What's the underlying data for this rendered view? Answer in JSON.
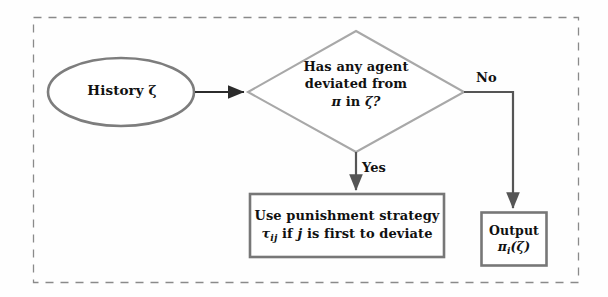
{
  "figure": {
    "type": "flowchart",
    "title": "",
    "background_color": "#fefefe",
    "border": {
      "style": "dashed",
      "color": "#8a8a8a"
    }
  },
  "nodes": {
    "history": {
      "shape": "ellipse",
      "label": "History ζ",
      "border_color": "#7d7d7d"
    },
    "decision": {
      "shape": "diamond",
      "line1": "Has any agent",
      "line2": "deviated from",
      "line3_prefix": "π",
      "line3_mid": " in ",
      "line3_suffix": "ζ?",
      "border_color": "#a0a0a0"
    },
    "punishment": {
      "shape": "rectangle",
      "line1": "Use punishment strategy",
      "line2_tau": "τ",
      "line2_tau_sub": "ij",
      "line2_rest_a": " if ",
      "line2_j": "j",
      "line2_rest_b": " is first to deviate",
      "border_color": "#777777"
    },
    "output": {
      "shape": "rectangle",
      "line1": "Output",
      "line2_pi": "π",
      "line2_pi_sub": "i",
      "line2_arg": "(ζ)",
      "border_color": "#777777"
    }
  },
  "edges": {
    "history_to_decision": {
      "label": "",
      "color": "#2b2b2b"
    },
    "decision_yes": {
      "label": "Yes",
      "color": "#555555"
    },
    "decision_no": {
      "label": "No",
      "color": "#555555"
    }
  }
}
